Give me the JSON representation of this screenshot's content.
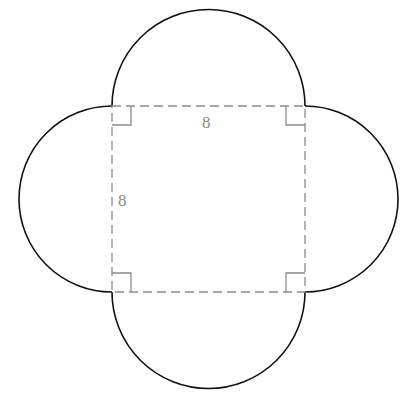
{
  "diagram": {
    "square": {
      "side_label_top": "8",
      "side_label_left": "8",
      "line_style": "dashed"
    },
    "right_angle_markers": 4,
    "colors": {
      "outline": "#111111",
      "dashed": "#8c8c8c",
      "label": "#8a8a8a"
    }
  }
}
